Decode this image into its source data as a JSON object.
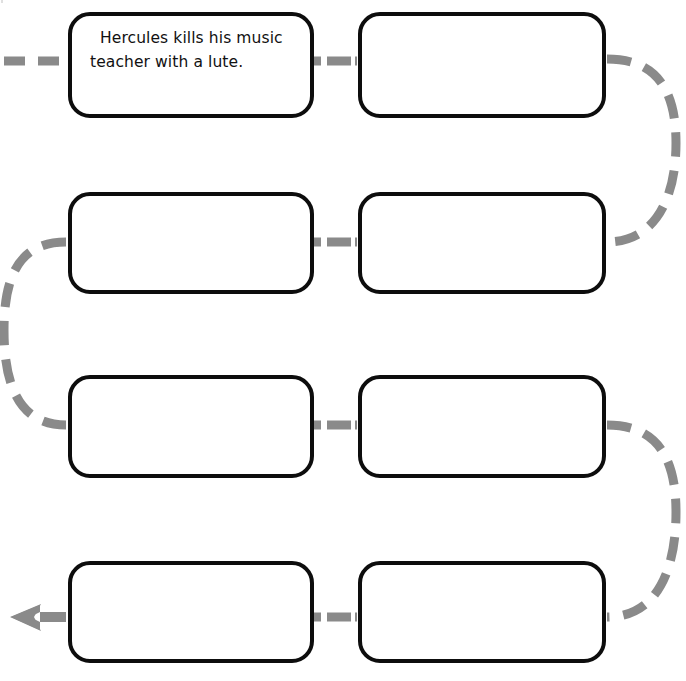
{
  "worksheet": {
    "title": "Sequence chain worksheet",
    "background_color": "#ffffff",
    "box_border_color": "#0d0d0d",
    "connector_color": "#8a8a8a",
    "width": 686,
    "height": 681
  },
  "boxes": [
    {
      "id": "box-1",
      "row": 1,
      "column": "left",
      "text": "Hercules kills his music teacher with a lute.",
      "filled": true
    },
    {
      "id": "box-2",
      "row": 1,
      "column": "right",
      "text": "",
      "filled": false
    },
    {
      "id": "box-3",
      "row": 2,
      "column": "left",
      "text": "",
      "filled": false
    },
    {
      "id": "box-4",
      "row": 2,
      "column": "right",
      "text": "",
      "filled": false
    },
    {
      "id": "box-5",
      "row": 3,
      "column": "left",
      "text": "",
      "filled": false
    },
    {
      "id": "box-6",
      "row": 3,
      "column": "right",
      "text": "",
      "filled": false
    },
    {
      "id": "box-7",
      "row": 4,
      "column": "left",
      "text": "",
      "filled": false
    },
    {
      "id": "box-8",
      "row": 4,
      "column": "right",
      "text": "",
      "filled": false
    }
  ],
  "connectors": [
    {
      "id": "entry-dashes",
      "kind": "dashed-segment",
      "from": "page-edge",
      "to": "box-1"
    },
    {
      "id": "row1-link",
      "kind": "dashed-segment",
      "from": "box-1",
      "to": "box-2"
    },
    {
      "id": "right-arc-top",
      "kind": "dashed-arc",
      "from": "box-2",
      "to": "box-4"
    },
    {
      "id": "row2-link",
      "kind": "dashed-segment",
      "from": "box-3",
      "to": "box-4"
    },
    {
      "id": "left-arc",
      "kind": "dashed-arc",
      "from": "box-3",
      "to": "box-5"
    },
    {
      "id": "row3-link",
      "kind": "dashed-segment",
      "from": "box-5",
      "to": "box-6"
    },
    {
      "id": "right-arc-bottom",
      "kind": "dashed-arc",
      "from": "box-6",
      "to": "box-8"
    },
    {
      "id": "row4-link",
      "kind": "dashed-segment",
      "from": "box-7",
      "to": "box-8"
    },
    {
      "id": "exit-arrow",
      "kind": "arrow-left",
      "from": "box-7",
      "to": "page-edge"
    }
  ]
}
